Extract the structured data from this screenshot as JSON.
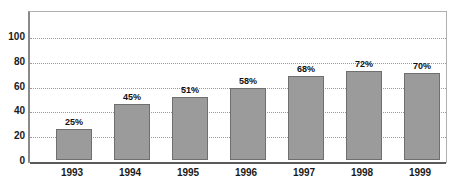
{
  "chart_data": {
    "type": "bar",
    "title": "",
    "subtitle": "",
    "xlabel": "",
    "ylabel": "",
    "categories": [
      "1993",
      "1994",
      "1995",
      "1996",
      "1997",
      "1998",
      "1999"
    ],
    "values": [
      25,
      45,
      51,
      58,
      68,
      72,
      70
    ],
    "data_labels": [
      "25%",
      "45%",
      "51%",
      "58%",
      "68%",
      "72%",
      "70%"
    ],
    "series": [
      {
        "name": "",
        "values": [
          25,
          45,
          51,
          58,
          68,
          72,
          70
        ]
      }
    ],
    "ylim": [
      0,
      100
    ],
    "yticks": [
      0,
      20,
      40,
      60,
      80,
      100
    ],
    "ytick_labels": [
      "0",
      "20",
      "40",
      "60",
      "80",
      "100"
    ],
    "grid": true,
    "grid_orientation": "horizontal",
    "legend": false,
    "legend_position": "none",
    "bar_color": "#9b9b9b",
    "bar_border_color": "#6f6f6f",
    "gridline_color": "#9a9a9a",
    "axis_color": "#5a5a5a",
    "frame_color": "#b0b0b0",
    "text_color": "#1a1a1a"
  }
}
